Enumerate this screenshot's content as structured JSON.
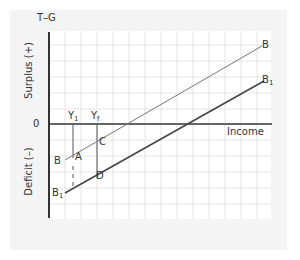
{
  "diagram": {
    "title_axis": "T–G",
    "y_axis_upper_label": "Surplus (+)",
    "y_axis_lower_label": "Deficit (–)",
    "zero_label": "0",
    "x_axis_label": "Income",
    "lines": [
      {
        "name": "B",
        "label_left": "B",
        "label_right": "B"
      },
      {
        "name": "B1",
        "label_left_main": "B",
        "label_left_sub": "1",
        "label_right_main": "B",
        "label_right_sub": "1"
      }
    ],
    "income_levels": [
      {
        "main": "Y",
        "sub": "1"
      },
      {
        "main": "Y",
        "sub": "f"
      }
    ],
    "points": [
      "A",
      "C",
      "D"
    ],
    "colors": {
      "panel_bg": "#f4f4f4",
      "grid_bg": "#ffffff",
      "grid_line": "#e2e2e2",
      "axis": "#333333",
      "line_B": "#777777",
      "line_B1": "#444444"
    }
  }
}
